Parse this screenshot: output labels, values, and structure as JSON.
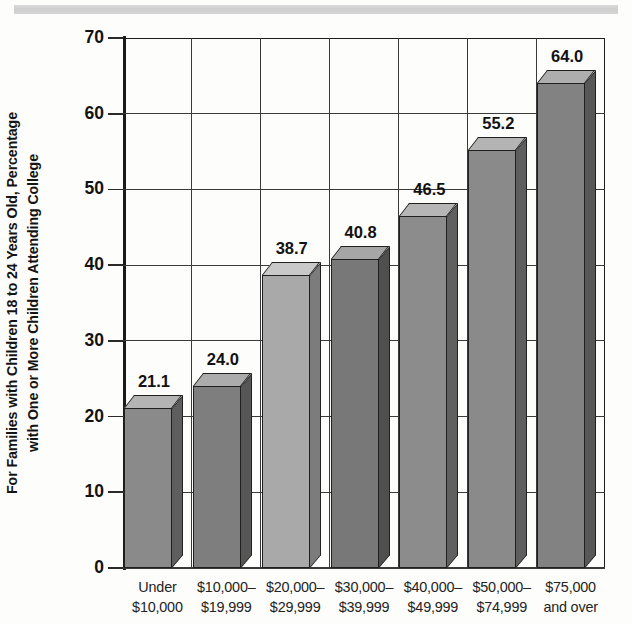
{
  "chart_data": {
    "type": "bar",
    "title": "",
    "subtitle": "",
    "xlabel": "",
    "ylabel": "For Families with Children 18 to 24 Years Old, Percentage with One or More Children Attending College",
    "ylabel_lines": [
      "For Families with Children 18 to 24 Years Old, Percentage",
      "with One or More Children Attending College"
    ],
    "categories": [
      "Under $10,000",
      "$10,000–$19,999",
      "$20,000–$29,999",
      "$30,000–$39,999",
      "$40,000–$49,999",
      "$50,000–$74,999",
      "$75,000 and over"
    ],
    "category_lines": [
      [
        "Under",
        "$10,000"
      ],
      [
        "$10,000–",
        "$19,999"
      ],
      [
        "$20,000–",
        "$29,999"
      ],
      [
        "$30,000–",
        "$39,999"
      ],
      [
        "$40,000–",
        "$49,999"
      ],
      [
        "$50,000–",
        "$74,999"
      ],
      [
        "$75,000",
        "and over"
      ]
    ],
    "values": [
      21.1,
      24.0,
      38.7,
      40.8,
      46.5,
      55.2,
      64.0
    ],
    "value_labels": [
      "21.1",
      "24.0",
      "38.7",
      "40.8",
      "46.5",
      "55.2",
      "64.0"
    ],
    "ylim": [
      0,
      70
    ],
    "yticks": [
      0,
      10,
      20,
      30,
      40,
      50,
      60,
      70
    ],
    "ytick_labels": [
      "0",
      "10",
      "20",
      "30",
      "40",
      "50",
      "60",
      "70"
    ],
    "grid": true,
    "grid_orientation": "both",
    "legend": false,
    "legend_position": "none",
    "style": "3d-bar-grayscale",
    "bar_colors": [
      "#8a8a8a",
      "#7e7e7e",
      "#a9a9a9",
      "#787878",
      "#8c8c8c",
      "#8a8a8a",
      "#828282"
    ],
    "bar_top_colors": [
      "#b4b4b4",
      "#acacac",
      "#c9c9c9",
      "#a6a6a6",
      "#b6b6b6",
      "#b4b4b4",
      "#aeaeae"
    ],
    "bar_side_colors": [
      "#5e5e5e",
      "#565656",
      "#7c7c7c",
      "#4f4f4f",
      "#606060",
      "#5e5e5e",
      "#585858"
    ],
    "axis_color": "#1d1d1d",
    "grid_color": "#3a3a3a",
    "background_color": "#fdfdfc"
  }
}
